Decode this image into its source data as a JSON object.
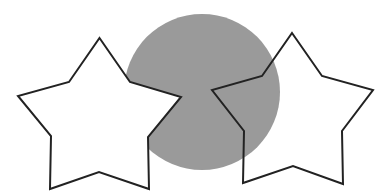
{
  "canvas": {
    "width": 380,
    "height": 194,
    "background": "#ffffff"
  },
  "shapes": [
    {
      "id": "circle",
      "type": "circle",
      "cx": 202,
      "cy": 92,
      "r": 78,
      "fill": "#9a9a9a",
      "stroke": "none",
      "z": 1
    },
    {
      "id": "left-star",
      "type": "star",
      "points": "99.5,38 130,82 181,97 148,137 149,189 99,172 50,189 51,136 18,96 69,82",
      "fill": "#ffffff",
      "stroke": "#222222",
      "stroke_width": 2,
      "z": 2
    },
    {
      "id": "right-star",
      "type": "star",
      "points": "292,33 322,76 373,90 342,131 343,184 293,166 243,183 244,131 212,90 262,76",
      "fill": "none",
      "stroke": "#222222",
      "stroke_width": 2,
      "z": 3
    }
  ]
}
